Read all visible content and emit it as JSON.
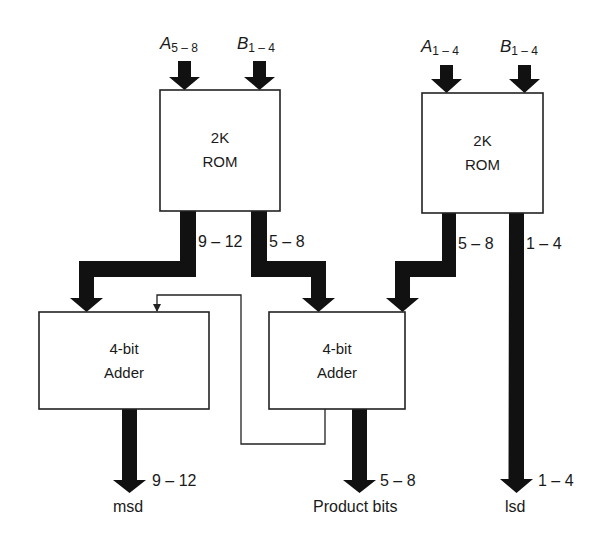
{
  "diagram": {
    "blocks": {
      "rom_left": {
        "line1": "2K",
        "line2": "ROM"
      },
      "rom_right": {
        "line1": "2K",
        "line2": "ROM"
      },
      "adder_left": {
        "line1": "4-bit",
        "line2": "Adder"
      },
      "adder_mid": {
        "line1": "4-bit",
        "line2": "Adder"
      }
    },
    "inputs": {
      "rom_left_a": {
        "var": "A",
        "sub": "5 – 8"
      },
      "rom_left_b": {
        "var": "B",
        "sub": "1 – 4"
      },
      "rom_right_a": {
        "var": "A",
        "sub": "1 – 4"
      },
      "rom_right_b": {
        "var": "B",
        "sub": "1 – 4"
      }
    },
    "bus_labels": {
      "rom_left_out_high": "9 – 12",
      "rom_left_out_low": "5 – 8",
      "rom_right_out_high": "5 – 8",
      "rom_right_out_low": "1 – 4",
      "out_msd_bits": "9 – 12",
      "out_product_bits": "5 – 8",
      "out_lsd_bits": "1 – 4"
    },
    "outputs": {
      "msd": "msd",
      "product": "Product bits",
      "lsd": "lsd"
    },
    "colors": {
      "line": "#111111",
      "box_border": "#222222",
      "background": "#ffffff"
    }
  }
}
